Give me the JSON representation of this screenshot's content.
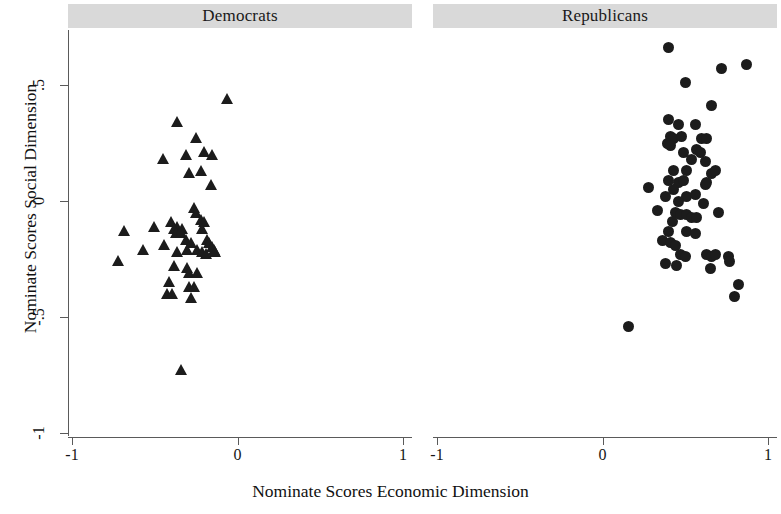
{
  "chart_data": {
    "type": "scatter",
    "title": "",
    "xlabel": "Nominate Scores Economic Dimension",
    "ylabel": "Nominate Scores Social Dimension",
    "xlim": [
      -1.12,
      1.12
    ],
    "ylim": [
      -1.06,
      0.72
    ],
    "xticks": [
      -1,
      0,
      1
    ],
    "xticklabels": [
      "-1",
      "0",
      "1"
    ],
    "yticks": [
      0.5,
      0,
      -0.5,
      -1
    ],
    "yticklabels": [
      ".5",
      "0",
      "-.5",
      "-1"
    ],
    "grid": false,
    "legend": "none",
    "marker_color": "#1c1c1c",
    "panel_header_color": "#d9d9d9",
    "panels": [
      {
        "label": "Democrats",
        "marker": "triangle",
        "points": [
          [
            -0.06,
            0.44
          ],
          [
            -0.36,
            0.34
          ],
          [
            -0.25,
            0.27
          ],
          [
            -0.31,
            0.2
          ],
          [
            -0.45,
            0.18
          ],
          [
            -0.2,
            0.21
          ],
          [
            -0.22,
            0.13
          ],
          [
            -0.29,
            0.12
          ],
          [
            -0.15,
            0.2
          ],
          [
            -0.16,
            0.07
          ],
          [
            -0.26,
            -0.03
          ],
          [
            -0.25,
            -0.05
          ],
          [
            -0.36,
            -0.11
          ],
          [
            -0.4,
            -0.09
          ],
          [
            -0.38,
            -0.12
          ],
          [
            -0.37,
            -0.14
          ],
          [
            -0.34,
            -0.14
          ],
          [
            -0.33,
            -0.12
          ],
          [
            -0.22,
            -0.08
          ],
          [
            -0.2,
            -0.09
          ],
          [
            -0.21,
            -0.12
          ],
          [
            -0.68,
            -0.13
          ],
          [
            -0.5,
            -0.11
          ],
          [
            -0.31,
            -0.17
          ],
          [
            -0.28,
            -0.18
          ],
          [
            -0.18,
            -0.17
          ],
          [
            -0.17,
            -0.18
          ],
          [
            -0.15,
            -0.2
          ],
          [
            -0.44,
            -0.19
          ],
          [
            -0.57,
            -0.21
          ],
          [
            -0.36,
            -0.22
          ],
          [
            -0.3,
            -0.21
          ],
          [
            -0.24,
            -0.21
          ],
          [
            -0.21,
            -0.22
          ],
          [
            -0.19,
            -0.23
          ],
          [
            -0.14,
            -0.21
          ],
          [
            -0.13,
            -0.22
          ],
          [
            -0.72,
            -0.26
          ],
          [
            -0.38,
            -0.28
          ],
          [
            -0.3,
            -0.29
          ],
          [
            -0.29,
            -0.31
          ],
          [
            -0.24,
            -0.31
          ],
          [
            -0.41,
            -0.35
          ],
          [
            -0.29,
            -0.37
          ],
          [
            -0.26,
            -0.37
          ],
          [
            -0.42,
            -0.4
          ],
          [
            -0.39,
            -0.4
          ],
          [
            -0.28,
            -0.42
          ],
          [
            -0.34,
            -0.73
          ]
        ]
      },
      {
        "label": "Republicans",
        "marker": "circle",
        "points": [
          [
            0.4,
            0.66
          ],
          [
            0.72,
            0.57
          ],
          [
            0.87,
            0.59
          ],
          [
            0.5,
            0.51
          ],
          [
            0.66,
            0.41
          ],
          [
            0.4,
            0.35
          ],
          [
            0.46,
            0.33
          ],
          [
            0.56,
            0.33
          ],
          [
            0.41,
            0.28
          ],
          [
            0.43,
            0.27
          ],
          [
            0.48,
            0.28
          ],
          [
            0.6,
            0.27
          ],
          [
            0.63,
            0.27
          ],
          [
            0.39,
            0.25
          ],
          [
            0.41,
            0.24
          ],
          [
            0.57,
            0.22
          ],
          [
            0.59,
            0.21
          ],
          [
            0.49,
            0.21
          ],
          [
            0.54,
            0.18
          ],
          [
            0.62,
            0.17
          ],
          [
            0.43,
            0.13
          ],
          [
            0.51,
            0.13
          ],
          [
            0.66,
            0.12
          ],
          [
            0.68,
            0.13
          ],
          [
            0.4,
            0.09
          ],
          [
            0.46,
            0.08
          ],
          [
            0.49,
            0.09
          ],
          [
            0.62,
            0.07
          ],
          [
            0.63,
            0.08
          ],
          [
            0.28,
            0.06
          ],
          [
            0.43,
            0.05
          ],
          [
            0.38,
            0.02
          ],
          [
            0.51,
            0.02
          ],
          [
            0.56,
            0.03
          ],
          [
            0.46,
            0.0
          ],
          [
            0.61,
            -0.01
          ],
          [
            0.33,
            -0.04
          ],
          [
            0.44,
            -0.05
          ],
          [
            0.47,
            -0.06
          ],
          [
            0.51,
            -0.06
          ],
          [
            0.54,
            -0.07
          ],
          [
            0.57,
            -0.07
          ],
          [
            0.7,
            -0.05
          ],
          [
            0.42,
            -0.09
          ],
          [
            0.4,
            -0.13
          ],
          [
            0.51,
            -0.13
          ],
          [
            0.56,
            -0.14
          ],
          [
            0.36,
            -0.17
          ],
          [
            0.41,
            -0.18
          ],
          [
            0.44,
            -0.19
          ],
          [
            0.47,
            -0.23
          ],
          [
            0.5,
            -0.24
          ],
          [
            0.45,
            -0.28
          ],
          [
            0.63,
            -0.23
          ],
          [
            0.66,
            -0.24
          ],
          [
            0.68,
            -0.23
          ],
          [
            0.76,
            -0.24
          ],
          [
            0.77,
            -0.26
          ],
          [
            0.38,
            -0.27
          ],
          [
            0.65,
            -0.29
          ],
          [
            0.82,
            -0.36
          ],
          [
            0.8,
            -0.41
          ],
          [
            0.16,
            -0.54
          ]
        ]
      }
    ]
  }
}
